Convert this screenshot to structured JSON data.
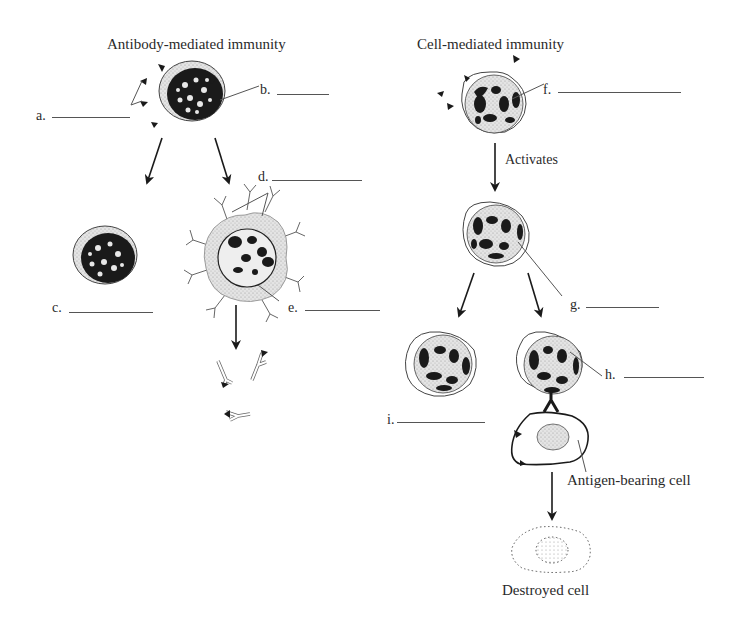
{
  "titles": {
    "left": "Antibody-mediated immunity",
    "right": "Cell-mediated immunity"
  },
  "labels": {
    "a": "a.",
    "b": "b.",
    "c": "c.",
    "d": "d.",
    "e": "e.",
    "f": "f.",
    "g": "g.",
    "h": "h.",
    "i": "i."
  },
  "annotations": {
    "activates": "Activates",
    "antigen_bearing_cell": "Antigen-bearing cell",
    "destroyed_cell": "Destroyed cell"
  },
  "colors": {
    "ink": "#1a1a1a",
    "stipple": "#cfcfcf",
    "line": "#555555"
  }
}
